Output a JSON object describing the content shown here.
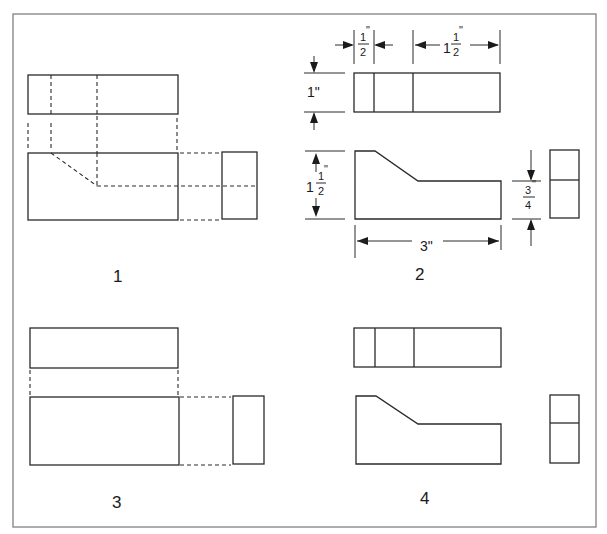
{
  "figure": {
    "colors": {
      "line": "#2a2a2a",
      "frame": "#8a8a8a",
      "background": "#ffffff"
    }
  },
  "options": [
    {
      "label": "1",
      "views": [
        "top view with hidden lines",
        "front view with hidden chamfer",
        "right side view"
      ],
      "line_style": "hidden (dashed) lines"
    },
    {
      "label": "2",
      "views": [
        "top view",
        "front view",
        "right side view"
      ],
      "line_style": "dimensioned"
    },
    {
      "label": "3",
      "views": [
        "top view",
        "front view",
        "right side view"
      ],
      "line_style": "plain rectangles"
    },
    {
      "label": "4",
      "views": [
        "top view",
        "front view",
        "right side view"
      ],
      "line_style": "visible lines, no dimensions"
    }
  ],
  "dimensions": {
    "top_left_width": {
      "whole": "",
      "num": "1",
      "den": "2",
      "unit": "\""
    },
    "top_right_width": {
      "whole": "1",
      "num": "1",
      "den": "2",
      "unit": "\""
    },
    "top_depth": {
      "text": "1\""
    },
    "front_height": {
      "whole": "1",
      "num": "1",
      "den": "2",
      "unit": "\""
    },
    "front_length": {
      "text": "3\""
    },
    "step_height": {
      "whole": "",
      "num": "3",
      "den": "4",
      "unit": "\""
    }
  }
}
